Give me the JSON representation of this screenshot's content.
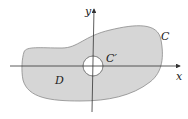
{
  "diagram": {
    "type": "region-with-hole",
    "region_label": "D",
    "outer_curve_label": "C",
    "inner_curve_label": "C′",
    "x_axis_label": "x",
    "y_axis_label": "y",
    "colors": {
      "region_fill": "#d6d6d6",
      "region_stroke": "#8a8a8a",
      "axis": "#333333",
      "hole_fill": "#ffffff"
    }
  }
}
